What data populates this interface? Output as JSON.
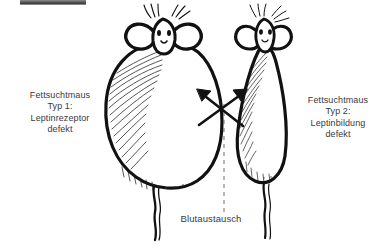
{
  "figure": {
    "width": 390,
    "height": 252,
    "background_color": "#ffffff",
    "ink_color": "#111111",
    "text_color": "#3a3a3a"
  },
  "topbar": {
    "name": "cropped-toolbar-strip",
    "color": "#4a4a4a"
  },
  "labels": {
    "left": {
      "line1": "Fettsuchtmaus",
      "line2": "Typ 1:",
      "line3": "Leptinrezeptor",
      "line4": "defekt"
    },
    "right": {
      "line1": "Fettsuchtmaus",
      "line2": "Typ 2:",
      "line3": "Leptinbildung",
      "line4": "defekt"
    },
    "exchange": "Blutaustausch"
  },
  "mice": [
    {
      "id": "mouse-left",
      "type": "Typ 1",
      "body_shape": "large-round-obese",
      "shading": "hatching-left-side",
      "parts": [
        "head",
        "left-ear",
        "right-ear",
        "left-eye",
        "right-eye",
        "nose",
        "whiskers",
        "body",
        "tail"
      ]
    },
    {
      "id": "mouse-right",
      "type": "Typ 2",
      "body_shape": "narrow-teardrop-slim",
      "shading": "hatching-left-side",
      "parts": [
        "head",
        "left-ear",
        "right-ear",
        "left-eye",
        "right-eye",
        "nose",
        "whiskers",
        "body",
        "tail"
      ]
    }
  ],
  "connectors": {
    "crossing_arrows": {
      "name": "blood-exchange-arrows",
      "description": "two crossed arrows indicating bidirectional blood exchange",
      "arrow_count": 2
    },
    "dashed_axis": {
      "name": "midline-dashed-line",
      "style": "dashed",
      "orientation": "vertical"
    }
  }
}
